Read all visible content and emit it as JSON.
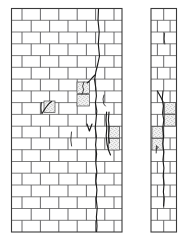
{
  "figure": {
    "type": "technical-line-drawing",
    "background_color": "#ffffff",
    "line_color": "#6e6e6e",
    "outline_color": "#3a3a3a",
    "crack_color": "#1b1b1b",
    "damage_fill_color": "#f2f2f2",
    "damage_speck_color": "#4d4d4d"
  },
  "panels": [
    {
      "id": "left-panel",
      "name": "wide-wall-elevation",
      "x": 11.5,
      "y": 8.5,
      "width": 110.5,
      "height": 223.5,
      "bond": "running-bond",
      "course_count": 19,
      "course_height": 11.76,
      "brick_length": 18.4,
      "offset_pattern": [
        0,
        0.5
      ]
    },
    {
      "id": "right-panel",
      "name": "narrow-wall-elevation",
      "x": 151.0,
      "y": 8.5,
      "width": 25.5,
      "height": 223.5,
      "bond": "running-bond",
      "course_count": 19,
      "course_height": 11.76,
      "brick_length": 12.75,
      "offset_pattern": [
        0,
        0.5
      ]
    }
  ],
  "left_panel_courses": [
    {
      "index": 0,
      "y": 8.5,
      "joints": [
        22.0,
        40.4,
        58.8,
        77.2,
        95.6,
        114.0
      ]
    },
    {
      "index": 1,
      "y": 20.3,
      "joints": [
        31.2,
        49.6,
        68.0,
        86.4,
        104.8
      ]
    },
    {
      "index": 2,
      "y": 32.0,
      "joints": [
        22.0,
        40.4,
        58.8,
        77.2,
        95.6,
        114.0
      ]
    },
    {
      "index": 3,
      "y": 43.8,
      "joints": [
        31.2,
        49.6,
        68.0,
        86.4,
        104.8
      ]
    },
    {
      "index": 4,
      "y": 55.6,
      "joints": [
        22.0,
        40.4,
        58.8,
        77.2,
        95.6,
        114.0
      ]
    },
    {
      "index": 5,
      "y": 67.3,
      "joints": [
        31.2,
        49.6,
        68.0,
        86.4,
        104.8
      ]
    },
    {
      "index": 6,
      "y": 79.1,
      "joints": [
        22.0,
        40.4,
        58.8,
        77.2,
        95.6,
        114.0
      ]
    },
    {
      "index": 7,
      "y": 90.9,
      "joints": [
        31.2,
        49.6,
        68.0,
        86.4,
        104.8
      ]
    },
    {
      "index": 8,
      "y": 102.6,
      "joints": [
        22.0,
        40.4,
        58.8,
        77.2,
        95.6,
        114.0
      ]
    },
    {
      "index": 9,
      "y": 114.4,
      "joints": [
        31.2,
        49.6,
        68.0,
        86.4,
        104.8
      ]
    },
    {
      "index": 10,
      "y": 126.2,
      "joints": [
        22.0,
        40.4,
        58.8,
        77.2,
        95.6,
        114.0
      ]
    },
    {
      "index": 11,
      "y": 137.9,
      "joints": [
        31.2,
        49.6,
        68.0,
        86.4,
        104.8
      ]
    },
    {
      "index": 12,
      "y": 149.7,
      "joints": [
        22.0,
        40.4,
        58.8,
        77.2,
        95.6,
        114.0
      ]
    },
    {
      "index": 13,
      "y": 161.5,
      "joints": [
        31.2,
        49.6,
        68.0,
        86.4,
        104.8
      ]
    },
    {
      "index": 14,
      "y": 173.2,
      "joints": [
        22.0,
        40.4,
        58.8,
        77.2,
        95.6,
        114.0
      ]
    },
    {
      "index": 15,
      "y": 185.0,
      "joints": [
        31.2,
        49.6,
        68.0,
        86.4,
        104.8
      ]
    },
    {
      "index": 16,
      "y": 196.8,
      "joints": [
        22.0,
        40.4,
        58.8,
        77.2,
        95.6,
        114.0
      ]
    },
    {
      "index": 17,
      "y": 208.5,
      "joints": [
        31.2,
        49.6,
        68.0,
        86.4,
        104.8
      ]
    },
    {
      "index": 18,
      "y": 220.3,
      "joints": [
        22.0,
        40.4,
        58.8,
        77.2,
        95.6,
        114.0
      ]
    }
  ],
  "right_panel_courses": [
    {
      "index": 0,
      "y": 8.5,
      "joints": [
        163.7
      ]
    },
    {
      "index": 1,
      "y": 20.3,
      "joints": [
        157.4,
        170.1
      ]
    },
    {
      "index": 2,
      "y": 32.0,
      "joints": [
        163.7
      ]
    },
    {
      "index": 3,
      "y": 43.8,
      "joints": [
        157.4,
        170.1
      ]
    },
    {
      "index": 4,
      "y": 55.6,
      "joints": [
        163.7
      ]
    },
    {
      "index": 5,
      "y": 67.3,
      "joints": [
        157.4,
        170.1
      ]
    },
    {
      "index": 6,
      "y": 79.1,
      "joints": [
        163.7
      ]
    },
    {
      "index": 7,
      "y": 90.9,
      "joints": [
        157.4,
        170.1
      ]
    },
    {
      "index": 8,
      "y": 102.6,
      "joints": [
        163.7
      ]
    },
    {
      "index": 9,
      "y": 114.4,
      "joints": [
        157.4,
        170.1
      ]
    },
    {
      "index": 10,
      "y": 126.2,
      "joints": [
        163.7
      ]
    },
    {
      "index": 11,
      "y": 137.9,
      "joints": [
        157.4,
        170.1
      ]
    },
    {
      "index": 12,
      "y": 149.7,
      "joints": [
        163.7
      ]
    },
    {
      "index": 13,
      "y": 161.5,
      "joints": [
        157.4,
        170.1
      ]
    },
    {
      "index": 14,
      "y": 173.2,
      "joints": [
        163.7
      ]
    },
    {
      "index": 15,
      "y": 185.0,
      "joints": [
        157.4,
        170.1
      ]
    },
    {
      "index": 16,
      "y": 196.8,
      "joints": [
        163.7
      ]
    },
    {
      "index": 17,
      "y": 208.5,
      "joints": [
        157.4,
        170.1
      ]
    },
    {
      "index": 18,
      "y": 220.3,
      "joints": [
        163.7
      ]
    }
  ],
  "cracks": [
    {
      "id": "crack-main-left",
      "panel": "left-panel",
      "description": "primary near-vertical crack descending full height of right third",
      "path": "M 98.5,9 L 98.0,20 L 99.2,32 L 98.3,44 L 99.5,56 L 97.8,64 L 95.8,72 L 94.6,80 L 95.8,88 L 96.4,96 L 95.4,103 L 96.8,111 L 96.0,120 L 95.2,128 L 96.4,136 L 95.6,145 L 96.6,154 L 95.8,163 L 96.8,172 L 95.9,181 L 96.9,190 L 96.2,199 L 97.2,208 L 96.4,217 L 97.0,226 L 96.6,231.5"
    },
    {
      "id": "crack-branch-upper",
      "panel": "left-panel",
      "description": "short branch crack angling left from main crack near mid-height",
      "path": "M 95.0,75 L 92.0,78 L 89.5,81 L 87.2,83"
    },
    {
      "id": "crack-hook-left",
      "panel": "left-panel",
      "description": "hooked crack segment within stippled zone",
      "path": "M 84.0,82 L 82.6,86 L 83.6,90 L 82.0,94"
    },
    {
      "id": "crack-diagonal-midleft",
      "panel": "left-panel",
      "description": "diagonal crack through brick left of centre",
      "path": "M 42.0,113.5 L 45.5,108.0 L 49.0,103.5 L 51.5,101.5"
    },
    {
      "id": "crack-short-vertical-left",
      "panel": "left-panel",
      "description": "short vertical crack next to diagonal crack",
      "path": "M 41.5,102.5 L 41.0,108 L 41.6,113"
    },
    {
      "id": "crack-hook-right-upper",
      "panel": "left-panel",
      "description": "small hook shaped crack right of main crack",
      "path": "M 104.0,95 L 103.0,99 L 103.8,104 L 105.4,106"
    },
    {
      "id": "crack-secondary-right",
      "panel": "left-panel",
      "description": "secondary vertical crack pair right of main crack",
      "path": "M 106.6,112 L 106.0,120 L 106.8,128 L 106.2,136 L 107.0,144 L 108.5,150 L 110.5,155"
    },
    {
      "id": "crack-secondary-right-twin",
      "panel": "left-panel",
      "description": "parallel twin of secondary vertical crack",
      "path": "M 109.0,112 L 108.4,120 L 109.2,128 L 108.6,136 L 109.4,143"
    },
    {
      "id": "crack-vee-center",
      "panel": "left-panel",
      "description": "V shaped crack notch below centre",
      "path": "M 87.0,124 L 89.4,131 L 92.0,124"
    },
    {
      "id": "crack-short-mid",
      "panel": "left-panel",
      "description": "short vertical crack below V notch",
      "path": "M 71.5,132 L 70.8,140 L 71.6,146"
    },
    {
      "id": "crack-main-right",
      "panel": "right-panel",
      "description": "primary crack in narrow panel descending from upper third",
      "path": "M 163.0,91 L 162.2,99 L 163.4,106 L 162.6,113 L 163.8,120 L 162.8,128 L 163.6,136 L 162.8,144 L 163.8,152 L 163.0,160 L 163.9,168 L 163.2,176 L 164.0,184 L 163.4,192 L 164.2,199 L 163.6,206"
    },
    {
      "id": "crack-branch-right-upper",
      "panel": "right-panel",
      "description": "branch crack angling from panel top area into damage zone",
      "path": "M 157.4,91 L 159.6,95 L 161.8,99 L 163.0,102"
    },
    {
      "id": "crack-short-right-top",
      "panel": "right-panel",
      "description": "short vertical crack high in narrow panel",
      "path": "M 164.6,33 L 164.2,39 L 164.8,44"
    },
    {
      "id": "crack-flag-right-lower",
      "panel": "right-panel",
      "description": "small flag shaped crack marker in lower half",
      "path": "M 156.4,146 L 156.2,153 M 156.4,146 L 158.4,147.5 L 156.3,149"
    }
  ],
  "damage_zones": [
    {
      "id": "damage-left-mid",
      "panel": "left-panel",
      "x": 44.0,
      "y": 101.0,
      "width": 11.0,
      "height": 11.5,
      "label": "crushed-brick-zone"
    },
    {
      "id": "damage-left-upper",
      "panel": "left-panel",
      "x": 77.0,
      "y": 82.0,
      "width": 12.5,
      "height": 11.5,
      "label": "crushed-brick-zone"
    },
    {
      "id": "damage-left-upper-2",
      "panel": "left-panel",
      "x": 77.0,
      "y": 94.5,
      "width": 12.5,
      "height": 11.5,
      "label": "crushed-brick-zone"
    },
    {
      "id": "damage-left-lower",
      "panel": "left-panel",
      "x": 108.5,
      "y": 126.5,
      "width": 11.0,
      "height": 11.5,
      "label": "crushed-brick-zone"
    },
    {
      "id": "damage-left-lower-2",
      "panel": "left-panel",
      "x": 108.5,
      "y": 138.5,
      "width": 11.0,
      "height": 11.5,
      "label": "crushed-brick-zone"
    },
    {
      "id": "damage-right-upper",
      "panel": "right-panel",
      "x": 164.5,
      "y": 102.5,
      "width": 11.0,
      "height": 11.5,
      "label": "crushed-brick-zone"
    },
    {
      "id": "damage-right-mid",
      "panel": "right-panel",
      "x": 164.5,
      "y": 114.5,
      "width": 11.0,
      "height": 11.5,
      "label": "crushed-brick-zone"
    },
    {
      "id": "damage-right-left",
      "panel": "right-panel",
      "x": 152.0,
      "y": 126.5,
      "width": 11.0,
      "height": 11.5,
      "label": "crushed-brick-zone"
    },
    {
      "id": "damage-right-left-2",
      "panel": "right-panel",
      "x": 152.0,
      "y": 138.5,
      "width": 11.0,
      "height": 11.5,
      "label": "crushed-brick-zone"
    }
  ]
}
